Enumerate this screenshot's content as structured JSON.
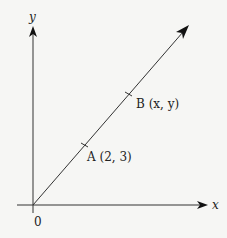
{
  "diagram": {
    "type": "coordinate-line",
    "axes": {
      "x_label": "x",
      "y_label": "y",
      "origin_label": "0"
    },
    "points": [
      {
        "name": "A",
        "label": "A (2, 3)",
        "coords": "(2, 3)"
      },
      {
        "name": "B",
        "label": "B (x, y)",
        "coords": "(x, y)"
      }
    ],
    "line": {
      "from": "origin",
      "through": [
        "A",
        "B"
      ],
      "direction": "up-right arrow"
    },
    "colors": {
      "stroke": "#222222",
      "background": "#f6f6f4"
    }
  }
}
